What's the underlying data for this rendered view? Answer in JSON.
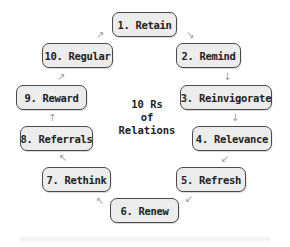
{
  "diagram": {
    "title_lines": [
      "10 Rs",
      "of",
      "Relations"
    ],
    "type": "cycle",
    "box_fill": "#ececec",
    "box_border": "#4a4a4a",
    "arrow_color": "#9a9a9a",
    "nodes": [
      {
        "label": "1. Retain"
      },
      {
        "label": "2. Remind"
      },
      {
        "label": "3. Reinvigorate"
      },
      {
        "label": "4. Relevance"
      },
      {
        "label": "5. Refresh"
      },
      {
        "label": "6. Renew"
      },
      {
        "label": "7. Rethink"
      },
      {
        "label": "8. Referrals"
      },
      {
        "label": "9. Reward"
      },
      {
        "label": "10. Regular"
      }
    ],
    "arrows": {
      "a1": "↘",
      "a2": "↓",
      "a3": "↓",
      "a4": "↙",
      "a5": "↙",
      "a6": "↖",
      "a7": "↖",
      "a8": "↑",
      "a9": "↗",
      "a10": "↗"
    }
  }
}
